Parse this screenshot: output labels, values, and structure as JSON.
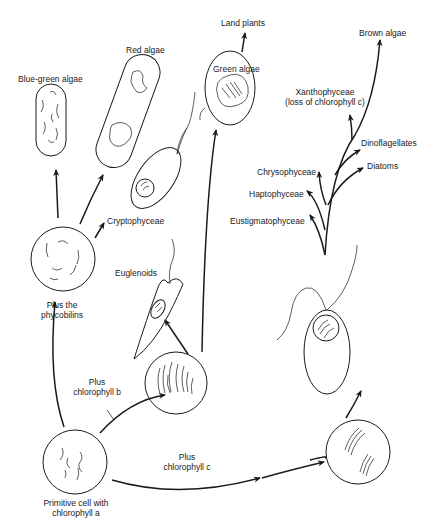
{
  "diagram": {
    "type": "evolutionary-lineage",
    "nodes": {
      "primitive_cell": {
        "label_line1": "Primitive cell with",
        "label_line2": "chlorophyll a"
      },
      "phycobilin_cell": {
        "label_line1": "Plus the",
        "label_line2": "phycobilins"
      },
      "chl_b_cell": {
        "label": ""
      },
      "chl_c_cell": {
        "label": ""
      },
      "blue_green_algae": {
        "label": "Blue-green algae"
      },
      "red_algae": {
        "label": "Red algae"
      },
      "cryptophyceae": {
        "label": "Cryptophyceae"
      },
      "euglenoids": {
        "label": "Euglenoids"
      },
      "green_algae": {
        "label": "Green algae"
      },
      "land_plants": {
        "label": "Land plants"
      },
      "brown_algae": {
        "label": "Brown algae"
      },
      "xanthophyceae": {
        "label_line1": "Xanthophyceae",
        "label_line2": "(loss of chlorophyll c)"
      },
      "dinoflagellates": {
        "label": "Dinoflagellates"
      },
      "diatoms": {
        "label": "Diatoms"
      },
      "chrysophyceae": {
        "label": "Chrysophyceae"
      },
      "haptophyceae": {
        "label": "Haptophyceae"
      },
      "eustigmatophyceae": {
        "label": "Eustigmatophyceae"
      }
    },
    "edges": [
      {
        "from": "primitive_cell",
        "to": "phycobilin_cell"
      },
      {
        "from": "primitive_cell",
        "to": "chl_b_cell",
        "label_line1": "Plus",
        "label_line2": "chlorophyll b"
      },
      {
        "from": "primitive_cell",
        "to": "chl_c_cell",
        "label_line1": "Plus",
        "label_line2": "chlorophyll c"
      },
      {
        "from": "phycobilin_cell",
        "to": "blue_green_algae"
      },
      {
        "from": "phycobilin_cell",
        "to": "red_algae"
      },
      {
        "from": "phycobilin_cell",
        "to": "cryptophyceae"
      },
      {
        "from": "chl_b_cell",
        "to": "euglenoids"
      },
      {
        "from": "chl_b_cell",
        "to": "green_algae"
      },
      {
        "from": "green_algae",
        "to": "land_plants"
      },
      {
        "from": "chl_c_cell",
        "to": "heterokont_cell"
      },
      {
        "from": "heterokont_cell",
        "to": "eustigmatophyceae"
      },
      {
        "from": "heterokont_cell",
        "to": "haptophyceae"
      },
      {
        "from": "heterokont_cell",
        "to": "chrysophyceae"
      },
      {
        "from": "heterokont_cell",
        "to": "diatoms"
      },
      {
        "from": "heterokont_cell",
        "to": "dinoflagellates"
      },
      {
        "from": "heterokont_cell",
        "to": "xanthophyceae"
      },
      {
        "from": "heterokont_cell",
        "to": "brown_algae"
      }
    ]
  },
  "colors": {
    "ink": "#1a1a1a",
    "background": "#ffffff"
  }
}
